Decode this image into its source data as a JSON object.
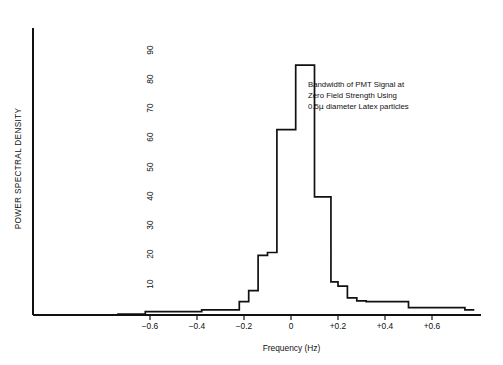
{
  "chart_data": {
    "type": "line",
    "title": "",
    "xlabel": "Frequency (Hz)",
    "ylabel": "POWER SPECTRAL DENSITY",
    "xlim": [
      -0.74,
      0.78
    ],
    "ylim": [
      0,
      97
    ],
    "grid": false,
    "legend": null,
    "xticks": [
      -0.6,
      -0.4,
      -0.2,
      0,
      0.2,
      0.4,
      0.6
    ],
    "xticklabels": [
      "−0.6",
      "−0.4",
      "−0.2",
      "0",
      "+0.2",
      "+0.4",
      "+0.6"
    ],
    "yticks": [
      10,
      20,
      30,
      40,
      50,
      60,
      70,
      80,
      90
    ],
    "yticklabels": [
      "10",
      "20",
      "30",
      "40",
      "50",
      "60",
      "70",
      "80",
      "90"
    ],
    "style": "step",
    "series": [
      {
        "name": "PMT signal power spectral density",
        "x": [
          -0.74,
          -0.62,
          -0.56,
          -0.5,
          -0.44,
          -0.38,
          -0.32,
          -0.26,
          -0.22,
          -0.18,
          -0.14,
          -0.1,
          -0.06,
          -0.02,
          0.02,
          0.06,
          0.1,
          0.14,
          0.17,
          0.2,
          0.24,
          0.28,
          0.32,
          0.38,
          0.44,
          0.5,
          0.56,
          0.62,
          0.68,
          0.74,
          0.78
        ],
        "values": [
          0,
          0.8,
          0.8,
          0.8,
          0.8,
          1.4,
          1.4,
          1.4,
          4.2,
          8.0,
          20.0,
          21.0,
          63.0,
          63.0,
          85.0,
          85.0,
          40.0,
          40.0,
          11.0,
          9.5,
          5.5,
          4.5,
          4.2,
          4.2,
          4.2,
          2.2,
          2.2,
          2.2,
          2.2,
          1.4,
          1.4
        ]
      }
    ],
    "annotations": [
      {
        "lines": [
          "Bandwidth of PMT Signal at",
          "Zero Field Strength Using",
          "0.5μ diameter Latex particles"
        ],
        "x": 0.1,
        "y": 78
      }
    ],
    "colors": {
      "line": "#111111",
      "axis": "#111111",
      "background": "#ffffff"
    }
  },
  "axis_titles": {
    "y": "POWER SPECTRAL DENSITY",
    "x": "Frequency (Hz)"
  },
  "annotation": {
    "line1": "Bandwidth of PMT Signal at",
    "line2": "Zero Field Strength Using",
    "line3_pre": "0.5",
    "line3_mu": "μ",
    "line3_post": " diameter Latex particles"
  }
}
